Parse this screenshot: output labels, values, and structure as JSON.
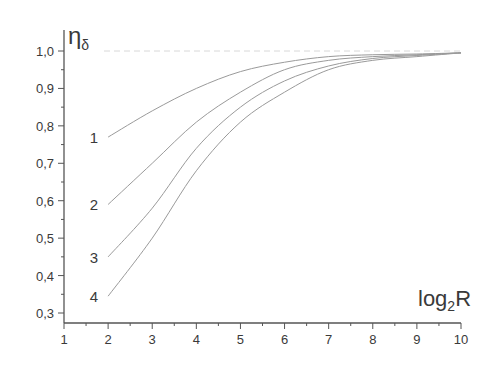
{
  "chart_data": {
    "type": "line",
    "title": "",
    "xlabel": "log2R",
    "ylabel": "η_δ",
    "ylabel_main": "η",
    "ylabel_sub": "δ",
    "xlabel_main": "log",
    "xlabel_sub": "2",
    "xlabel_tail": "R",
    "xlim": [
      1,
      10
    ],
    "ylim": [
      0.3,
      1.0
    ],
    "grid": false,
    "legend": "inline curve numbers",
    "x_ticks": [
      "1",
      "2",
      "3",
      "4",
      "5",
      "6",
      "7",
      "8",
      "9",
      "10"
    ],
    "y_ticks": [
      "0,3",
      "0,4",
      "0,5",
      "0,6",
      "0,7",
      "0,8",
      "0,9",
      "1,0"
    ],
    "reference_line": {
      "y": 1.0,
      "style": "dotted"
    },
    "x": [
      2,
      3,
      4,
      5,
      6,
      7,
      8,
      9,
      10
    ],
    "series": [
      {
        "name": "1",
        "values": [
          0.77,
          0.84,
          0.9,
          0.945,
          0.97,
          0.985,
          0.99,
          0.992,
          0.995
        ]
      },
      {
        "name": "2",
        "values": [
          0.59,
          0.7,
          0.81,
          0.89,
          0.95,
          0.975,
          0.985,
          0.99,
          0.995
        ]
      },
      {
        "name": "3",
        "values": [
          0.45,
          0.58,
          0.74,
          0.85,
          0.92,
          0.96,
          0.98,
          0.988,
          0.995
        ]
      },
      {
        "name": "4",
        "values": [
          0.345,
          0.5,
          0.68,
          0.81,
          0.89,
          0.95,
          0.975,
          0.985,
          0.995
        ]
      }
    ]
  }
}
